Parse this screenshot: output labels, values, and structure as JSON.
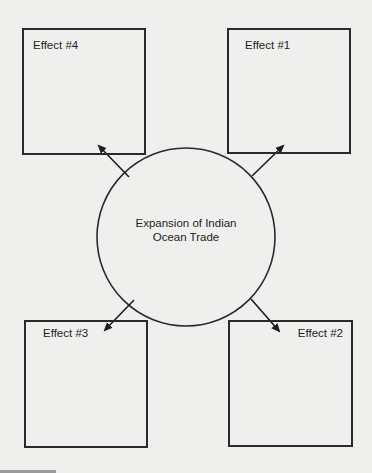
{
  "diagram": {
    "center": {
      "line1": "Expansion of Indian",
      "line2": "Ocean Trade"
    },
    "effects": [
      {
        "id": "effect-1",
        "label": "Effect #1",
        "position": "top-right"
      },
      {
        "id": "effect-2",
        "label": "Effect #2",
        "position": "bottom-right"
      },
      {
        "id": "effect-3",
        "label": "Effect #3",
        "position": "bottom-left"
      },
      {
        "id": "effect-4",
        "label": "Effect #4",
        "position": "top-left"
      }
    ],
    "colors": {
      "background": "#efefed",
      "stroke": "#2a2a2a",
      "text": "#1e1e1e"
    }
  }
}
